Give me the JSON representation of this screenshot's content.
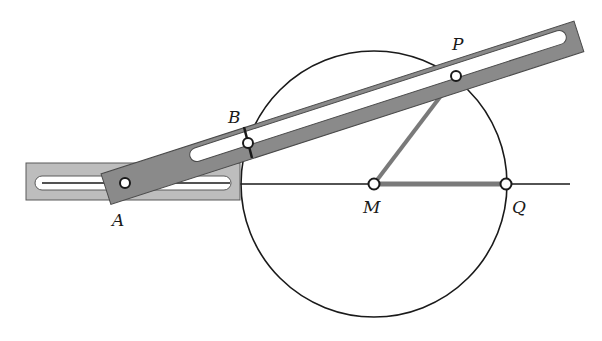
{
  "figure": {
    "colors": {
      "background": "#ffffff",
      "line": "#1a1a1a",
      "bar_fill": "#8a8a8a",
      "slider_fill": "#bdbdbd",
      "rod": "#7a7a7a"
    },
    "labels": {
      "A": "A",
      "B": "B",
      "P": "P",
      "M": "M",
      "Q": "Q"
    },
    "points": {
      "A": [
        125,
        183
      ],
      "B": [
        248,
        143
      ],
      "P": [
        456,
        76
      ],
      "M": [
        374,
        184
      ],
      "Q": [
        506,
        184
      ]
    },
    "circle": {
      "cx": 374,
      "cy": 184,
      "r": 133
    },
    "axis_line": {
      "x1": 240,
      "x2": 570,
      "y": 184
    }
  }
}
